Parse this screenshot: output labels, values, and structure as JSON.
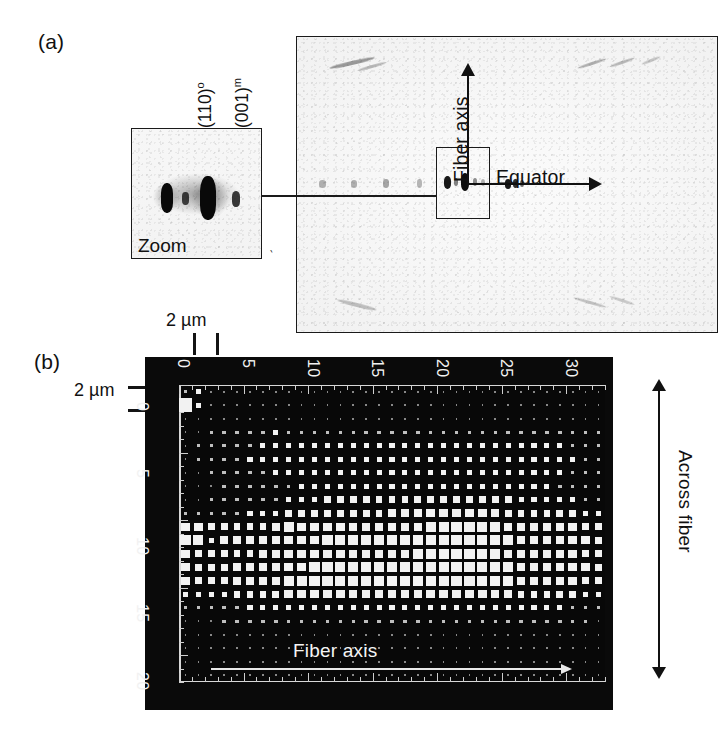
{
  "figure": {
    "panels": [
      {
        "id": "a",
        "label": "(a)"
      },
      {
        "id": "b",
        "label": "(b)"
      }
    ]
  },
  "panel_a": {
    "label": "(a)",
    "zoom_inset": {
      "caption": "Zoom",
      "reflections": [
        {
          "label": "(110)",
          "superscript": "o"
        },
        {
          "label": "(001)",
          "superscript": "m"
        }
      ]
    },
    "pattern_axes": {
      "vertical_label": "Fiber axis",
      "horizontal_label": "Equator"
    }
  },
  "panel_b": {
    "label": "(b)",
    "scale_bar_top": "2 µm",
    "scale_bar_left": "2 µm",
    "x_axis": {
      "label": "Fiber axis",
      "ticks": [
        0,
        5,
        10,
        15,
        20,
        25,
        30
      ],
      "min": 0,
      "max": 32
    },
    "y_axis": {
      "label": "Across fiber",
      "ticks": [
        0,
        5,
        10,
        15,
        20
      ],
      "min": 0,
      "max": 21
    }
  },
  "chart_data": {
    "type": "heatmap",
    "title": "",
    "subtitle": "",
    "xlabel": "Fiber axis",
    "ylabel": "Across fiber",
    "xlim": [
      0,
      32
    ],
    "ylim": [
      0,
      21
    ],
    "xticks": [
      0,
      5,
      10,
      15,
      20,
      25,
      30
    ],
    "yticks": [
      0,
      5,
      10,
      15,
      20
    ],
    "grid": true,
    "legend": null,
    "colormap": "white-squares-on-black",
    "encoding": "square area proportional to diffracted intensity",
    "cell_size_um": 2,
    "annotations": [
      "Fiber axis",
      "Across fiber",
      "2 µm"
    ],
    "nx": 33,
    "ny": 22,
    "values": [
      [
        2,
        3,
        1,
        1,
        1,
        1,
        1,
        1,
        1,
        1,
        1,
        1,
        1,
        1,
        1,
        1,
        1,
        1,
        1,
        1,
        1,
        1,
        1,
        1,
        1,
        1,
        1,
        1,
        1,
        1,
        1,
        1,
        1
      ],
      [
        9,
        3,
        1,
        1,
        1,
        1,
        1,
        1,
        1,
        1,
        1,
        1,
        1,
        1,
        1,
        1,
        1,
        1,
        1,
        1,
        1,
        1,
        1,
        1,
        1,
        1,
        1,
        1,
        1,
        1,
        1,
        1,
        1
      ],
      [
        1,
        1,
        1,
        1,
        1,
        1,
        1,
        1,
        1,
        1,
        1,
        1,
        1,
        1,
        1,
        1,
        1,
        1,
        1,
        1,
        1,
        1,
        1,
        1,
        1,
        1,
        1,
        1,
        1,
        1,
        1,
        1,
        1
      ],
      [
        1,
        1,
        2,
        2,
        2,
        2,
        2,
        3,
        2,
        2,
        2,
        2,
        2,
        2,
        2,
        2,
        2,
        2,
        2,
        2,
        2,
        2,
        2,
        2,
        2,
        2,
        2,
        2,
        2,
        2,
        2,
        2,
        2
      ],
      [
        1,
        2,
        2,
        2,
        2,
        2,
        3,
        3,
        3,
        3,
        3,
        3,
        3,
        3,
        3,
        3,
        3,
        3,
        3,
        3,
        3,
        3,
        3,
        3,
        3,
        3,
        3,
        3,
        3,
        3,
        2,
        2,
        2
      ],
      [
        1,
        2,
        2,
        2,
        2,
        3,
        3,
        3,
        3,
        3,
        3,
        3,
        3,
        3,
        3,
        3,
        3,
        3,
        3,
        3,
        3,
        3,
        3,
        3,
        3,
        3,
        3,
        3,
        3,
        3,
        3,
        2,
        2
      ],
      [
        1,
        1,
        2,
        2,
        2,
        2,
        2,
        3,
        3,
        3,
        3,
        3,
        3,
        3,
        3,
        3,
        3,
        3,
        3,
        3,
        3,
        3,
        3,
        3,
        3,
        3,
        3,
        3,
        3,
        3,
        2,
        2,
        2
      ],
      [
        1,
        1,
        1,
        2,
        2,
        2,
        2,
        2,
        2,
        3,
        3,
        3,
        3,
        3,
        3,
        3,
        3,
        3,
        3,
        3,
        3,
        3,
        3,
        3,
        3,
        3,
        3,
        3,
        3,
        2,
        2,
        2,
        2
      ],
      [
        1,
        1,
        2,
        2,
        2,
        2,
        2,
        2,
        3,
        3,
        3,
        4,
        4,
        4,
        4,
        4,
        4,
        4,
        4,
        4,
        4,
        4,
        4,
        4,
        4,
        4,
        3,
        3,
        3,
        3,
        3,
        2,
        2
      ],
      [
        2,
        2,
        2,
        2,
        2,
        3,
        3,
        3,
        4,
        4,
        4,
        4,
        4,
        4,
        4,
        4,
        5,
        5,
        5,
        5,
        5,
        5,
        5,
        5,
        5,
        4,
        4,
        4,
        4,
        4,
        4,
        3,
        3
      ],
      [
        5,
        5,
        4,
        4,
        4,
        4,
        4,
        5,
        6,
        5,
        5,
        5,
        5,
        5,
        5,
        5,
        5,
        5,
        5,
        6,
        6,
        6,
        6,
        6,
        6,
        5,
        5,
        5,
        5,
        5,
        5,
        4,
        4
      ],
      [
        6,
        6,
        3,
        5,
        5,
        5,
        5,
        5,
        5,
        5,
        5,
        6,
        6,
        6,
        6,
        6,
        6,
        6,
        6,
        6,
        6,
        6,
        6,
        6,
        6,
        6,
        5,
        5,
        5,
        5,
        5,
        5,
        4
      ],
      [
        5,
        4,
        4,
        4,
        4,
        4,
        5,
        5,
        5,
        5,
        5,
        5,
        5,
        5,
        5,
        5,
        5,
        5,
        6,
        6,
        6,
        6,
        6,
        6,
        6,
        5,
        5,
        5,
        5,
        5,
        5,
        4,
        4
      ],
      [
        5,
        4,
        4,
        4,
        5,
        5,
        5,
        5,
        5,
        5,
        6,
        6,
        6,
        6,
        6,
        6,
        6,
        6,
        6,
        6,
        6,
        6,
        6,
        6,
        6,
        6,
        5,
        5,
        5,
        5,
        5,
        5,
        4
      ],
      [
        5,
        4,
        4,
        4,
        5,
        5,
        5,
        5,
        6,
        6,
        6,
        6,
        6,
        6,
        6,
        6,
        6,
        6,
        6,
        6,
        6,
        6,
        6,
        6,
        6,
        6,
        5,
        5,
        5,
        5,
        5,
        4,
        4
      ],
      [
        3,
        3,
        3,
        3,
        4,
        4,
        4,
        4,
        5,
        5,
        5,
        5,
        5,
        5,
        5,
        5,
        5,
        5,
        5,
        5,
        5,
        5,
        5,
        5,
        5,
        5,
        4,
        4,
        4,
        4,
        4,
        3,
        3
      ],
      [
        2,
        2,
        2,
        2,
        2,
        3,
        3,
        3,
        3,
        3,
        3,
        3,
        3,
        3,
        3,
        3,
        3,
        3,
        3,
        3,
        3,
        3,
        3,
        3,
        3,
        3,
        3,
        3,
        3,
        3,
        2,
        2,
        2
      ],
      [
        1,
        1,
        1,
        2,
        2,
        2,
        2,
        2,
        2,
        2,
        2,
        2,
        2,
        2,
        2,
        2,
        2,
        2,
        2,
        2,
        2,
        2,
        2,
        2,
        2,
        2,
        2,
        2,
        2,
        2,
        2,
        2,
        1
      ],
      [
        1,
        1,
        1,
        1,
        1,
        1,
        1,
        1,
        1,
        1,
        1,
        1,
        1,
        1,
        1,
        1,
        1,
        1,
        1,
        1,
        1,
        1,
        1,
        1,
        1,
        1,
        1,
        1,
        1,
        1,
        1,
        1,
        1
      ],
      [
        1,
        1,
        1,
        1,
        1,
        1,
        1,
        1,
        1,
        1,
        1,
        1,
        1,
        1,
        1,
        1,
        1,
        1,
        1,
        1,
        1,
        1,
        1,
        1,
        1,
        1,
        1,
        1,
        1,
        1,
        1,
        1,
        1
      ],
      [
        1,
        1,
        1,
        1,
        1,
        1,
        1,
        1,
        1,
        1,
        1,
        1,
        1,
        1,
        1,
        1,
        1,
        1,
        1,
        1,
        1,
        1,
        1,
        1,
        1,
        1,
        1,
        1,
        1,
        1,
        1,
        1,
        1
      ],
      [
        1,
        1,
        1,
        1,
        1,
        1,
        1,
        1,
        1,
        1,
        1,
        1,
        1,
        1,
        1,
        1,
        1,
        1,
        1,
        1,
        1,
        1,
        1,
        1,
        1,
        1,
        1,
        1,
        1,
        1,
        1,
        1,
        1
      ]
    ]
  },
  "colors": {
    "background": "#ffffff",
    "ink": "#111111",
    "map_background": "#0a0a0a",
    "map_square": "#f2f2f2",
    "film": "#f5f5f5"
  }
}
